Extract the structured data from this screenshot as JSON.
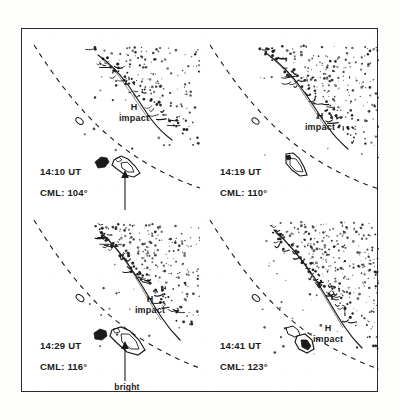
{
  "figure": {
    "kind": "four-panel limb imaging sequence",
    "frame_color": "#2b2b2b",
    "background_color": "#ffffff",
    "ink_color": "#1a1a1a"
  },
  "chart_data": {
    "type": "scatter",
    "title": "",
    "xlabel": "",
    "ylabel": "",
    "grid": false,
    "legend": null,
    "panels": [
      {
        "index": 0,
        "time": "14:10 UT",
        "cml": "CML: 104°",
        "cml_value": 104,
        "impact_label_line1": "H",
        "impact_label_line2": "impact",
        "bright_spot_line1": "bright",
        "bright_spot_line2": "spot",
        "has_bright_spot_arrow": true,
        "stipple_density": 0.55,
        "stipple_seed": 11
      },
      {
        "index": 1,
        "time": "14:19 UT",
        "cml": "CML: 110°",
        "cml_value": 110,
        "impact_label_line1": "H",
        "impact_label_line2": "impact",
        "bright_spot_line1": null,
        "bright_spot_line2": null,
        "has_bright_spot_arrow": false,
        "stipple_density": 0.62,
        "stipple_seed": 29
      },
      {
        "index": 2,
        "time": "14:29 UT",
        "cml": "CML: 116°",
        "cml_value": 116,
        "impact_label_line1": "H",
        "impact_label_line2": "impact",
        "bright_spot_line1": "bright",
        "bright_spot_line2": "spot",
        "has_bright_spot_arrow": true,
        "stipple_density": 0.78,
        "stipple_seed": 47
      },
      {
        "index": 3,
        "time": "14:41 UT",
        "cml": "CML: 123°",
        "cml_value": 123,
        "impact_label_line1": "H",
        "impact_label_line2": "impact",
        "bright_spot_line1": null,
        "bright_spot_line2": null,
        "has_bright_spot_arrow": false,
        "stipple_density": 0.85,
        "stipple_seed": 73
      }
    ]
  }
}
